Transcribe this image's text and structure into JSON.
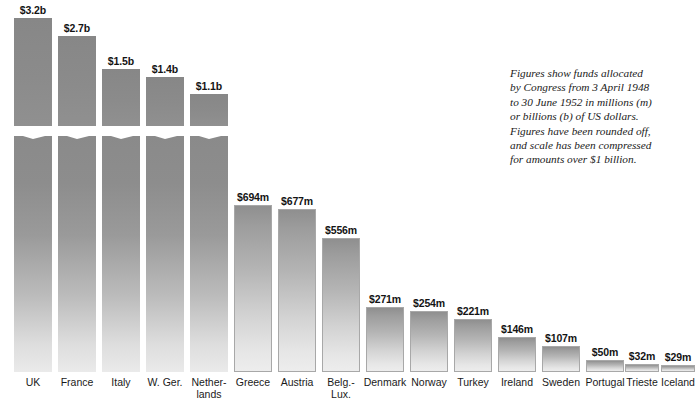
{
  "caption": {
    "lines": [
      "Figures show funds allocated",
      "by Congress from 3 April 1948",
      "to 30 June 1952 in millions (m)",
      "or billions (b) of US dollars.",
      "Figures have been rounded off,",
      "and scale has been compressed",
      "for amounts over $1 billion."
    ]
  },
  "chart_data": {
    "type": "bar",
    "title": "",
    "xlabel": "",
    "ylabel": "",
    "grid": false,
    "legend": "none",
    "note": "Scale compressed for amounts over $1 billion; zig-zag break drawn on the five tallest bars.",
    "categories": [
      "UK",
      "France",
      "Italy",
      "W. Ger.",
      "Netherlands",
      "Greece",
      "Austria",
      "Belg.-Lux.",
      "Denmark",
      "Norway",
      "Turkey",
      "Ireland",
      "Sweden",
      "Portugal",
      "Trieste",
      "Iceland"
    ],
    "labels_display": [
      {
        "l1": "UK",
        "l2": ""
      },
      {
        "l1": "France",
        "l2": ""
      },
      {
        "l1": "Italy",
        "l2": ""
      },
      {
        "l1": "W. Ger.",
        "l2": ""
      },
      {
        "l1": "Nether-",
        "l2": "lands"
      },
      {
        "l1": "Greece",
        "l2": ""
      },
      {
        "l1": "Austria",
        "l2": ""
      },
      {
        "l1": "Belg.-",
        "l2": "Lux."
      },
      {
        "l1": "Denmark",
        "l2": ""
      },
      {
        "l1": "Norway",
        "l2": ""
      },
      {
        "l1": "Turkey",
        "l2": ""
      },
      {
        "l1": "Ireland",
        "l2": ""
      },
      {
        "l1": "Sweden",
        "l2": ""
      },
      {
        "l1": "Portugal",
        "l2": ""
      },
      {
        "l1": "Trieste",
        "l2": ""
      },
      {
        "l1": "Iceland",
        "l2": ""
      }
    ],
    "values_millions": [
      3200,
      2700,
      1500,
      1400,
      1100,
      694,
      677,
      556,
      271,
      254,
      221,
      146,
      107,
      50,
      32,
      29
    ],
    "value_labels": [
      "$3.2b",
      "$2.7b",
      "$1.5b",
      "$1.4b",
      "$1.1b",
      "$694m",
      "$677m",
      "$556m",
      "$271m",
      "$254m",
      "$221m",
      "$146m",
      "$107m",
      "$50m",
      "$32m",
      "$29m"
    ],
    "bars": [
      {
        "x": 14,
        "w": 38,
        "h": 354,
        "upper": 108,
        "broken": true,
        "value": "$3.2b",
        "value_y": 372,
        "l1": "UK",
        "l2": ""
      },
      {
        "x": 58,
        "w": 38,
        "h": 336,
        "upper": 90,
        "broken": true,
        "value": "$2.7b",
        "value_y": 354,
        "l1": "France",
        "l2": ""
      },
      {
        "x": 102,
        "w": 38,
        "h": 303,
        "upper": 57,
        "broken": true,
        "value": "$1.5b",
        "value_y": 321,
        "l1": "Italy",
        "l2": ""
      },
      {
        "x": 146,
        "w": 38,
        "h": 295,
        "upper": 49,
        "broken": true,
        "value": "$1.4b",
        "value_y": 313,
        "l1": "W. Ger.",
        "l2": ""
      },
      {
        "x": 190,
        "w": 38,
        "h": 278,
        "upper": 32,
        "broken": true,
        "value": "$1.1b",
        "value_y": 296,
        "l1": "Nether-",
        "l2": "lands"
      },
      {
        "x": 234,
        "w": 38,
        "h": 167,
        "upper": 0,
        "broken": false,
        "value": "$694m",
        "value_y": 185,
        "l1": "Greece",
        "l2": ""
      },
      {
        "x": 278,
        "w": 38,
        "h": 163,
        "upper": 0,
        "broken": false,
        "value": "$677m",
        "value_y": 181,
        "l1": "Austria",
        "l2": ""
      },
      {
        "x": 322,
        "w": 38,
        "h": 134,
        "upper": 0,
        "broken": false,
        "value": "$556m",
        "value_y": 152,
        "l1": "Belg.-",
        "l2": "Lux."
      },
      {
        "x": 366,
        "w": 38,
        "h": 65,
        "upper": 0,
        "broken": false,
        "value": "$271m",
        "value_y": 83,
        "l1": "Denmark",
        "l2": ""
      },
      {
        "x": 410,
        "w": 38,
        "h": 61,
        "upper": 0,
        "broken": false,
        "value": "$254m",
        "value_y": 79,
        "l1": "Norway",
        "l2": ""
      },
      {
        "x": 454,
        "w": 38,
        "h": 53,
        "upper": 0,
        "broken": false,
        "value": "$221m",
        "value_y": 71,
        "l1": "Turkey",
        "l2": ""
      },
      {
        "x": 498,
        "w": 38,
        "h": 35,
        "upper": 0,
        "broken": false,
        "value": "$146m",
        "value_y": 53,
        "l1": "Ireland",
        "l2": ""
      },
      {
        "x": 542,
        "w": 38,
        "h": 26,
        "upper": 0,
        "broken": false,
        "value": "$107m",
        "value_y": 44,
        "l1": "Sweden",
        "l2": ""
      },
      {
        "x": 586,
        "w": 38,
        "h": 12,
        "upper": 0,
        "broken": false,
        "value": "$50m",
        "value_y": 30,
        "l1": "Portugal",
        "l2": ""
      },
      {
        "x": 625,
        "w": 34,
        "h": 8,
        "upper": 0,
        "broken": false,
        "value": "$32m",
        "value_y": 26,
        "l1": "Trieste",
        "l2": ""
      },
      {
        "x": 661,
        "w": 34,
        "h": 7,
        "upper": 0,
        "broken": false,
        "value": "$29m",
        "value_y": 25,
        "l1": "Iceland",
        "l2": ""
      }
    ]
  }
}
